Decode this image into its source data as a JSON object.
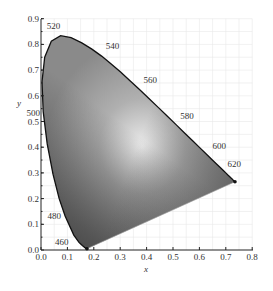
{
  "chart_data": {
    "type": "diagram",
    "xlabel": "x",
    "ylabel": "y",
    "xlim": [
      0.0,
      0.8
    ],
    "ylim": [
      0.0,
      0.9
    ],
    "x_ticks": [
      "0.0",
      "0.1",
      "0.2",
      "0.3",
      "0.4",
      "0.5",
      "0.6",
      "0.7",
      "0.8"
    ],
    "y_ticks": [
      "0.0",
      "0.1",
      "0.2",
      "0.3",
      "0.4",
      "0.5",
      "0.6",
      "0.7",
      "0.8",
      "0.9"
    ],
    "wavelength_labels": [
      {
        "nm": "460",
        "x": 0.144,
        "y": 0.03
      },
      {
        "nm": "480",
        "x": 0.091,
        "y": 0.133
      },
      {
        "nm": "500",
        "x": 0.008,
        "y": 0.538
      },
      {
        "nm": "520",
        "x": 0.074,
        "y": 0.834
      },
      {
        "nm": "540",
        "x": 0.23,
        "y": 0.754
      },
      {
        "nm": "560",
        "x": 0.373,
        "y": 0.624
      },
      {
        "nm": "580",
        "x": 0.512,
        "y": 0.487
      },
      {
        "nm": "600",
        "x": 0.627,
        "y": 0.372
      },
      {
        "nm": "620",
        "x": 0.691,
        "y": 0.308
      }
    ],
    "grid": true
  }
}
